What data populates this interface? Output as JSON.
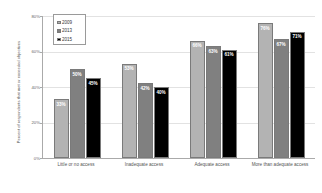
{
  "chart_data": {
    "type": "bar",
    "title": "",
    "xlabel": "",
    "ylabel": "Percent of respondents that met or exceeded objectives",
    "ylim": [
      0,
      80
    ],
    "ytick_labels": [
      "80%",
      "60%",
      "40%",
      "20%",
      "0%"
    ],
    "ytick_values": [
      80,
      60,
      40,
      20,
      0
    ],
    "grid": true,
    "legend_position": "top-left",
    "categories": [
      "Little or no access",
      "Inadequate access",
      "Adequate access",
      "More than adequate access"
    ],
    "series": [
      {
        "name": "2009",
        "color": "#b3b3b3",
        "values": [
          33,
          53,
          66,
          76
        ],
        "labels": [
          "33%",
          "53%",
          "66%",
          "76%"
        ]
      },
      {
        "name": "2013",
        "color": "#808080",
        "values": [
          50,
          42,
          63,
          67
        ],
        "labels": [
          "50%",
          "42%",
          "63%",
          "67%"
        ]
      },
      {
        "name": "2015",
        "color": "#000000",
        "values": [
          45,
          40,
          61,
          71
        ],
        "labels": [
          "45%",
          "40%",
          "61%",
          "71%"
        ]
      }
    ]
  },
  "axis": {
    "y_title": "Percent of respondents that met or exceeded objectives"
  },
  "legend": {
    "items": [
      {
        "label": "2009",
        "color": "#b3b3b3"
      },
      {
        "label": "2013",
        "color": "#808080"
      },
      {
        "label": "2015",
        "color": "#000000"
      }
    ]
  }
}
